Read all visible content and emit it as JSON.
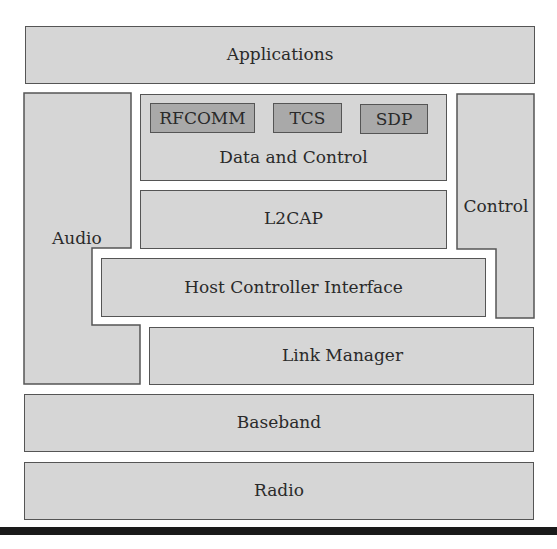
{
  "diagram": {
    "layers": {
      "applications": "Applications",
      "data_and_control": "Data and Control",
      "l2cap": "L2CAP",
      "hci": "Host Controller Interface",
      "link_manager": "Link Manager",
      "baseband": "Baseband",
      "radio": "Radio"
    },
    "side_blocks": {
      "audio": "Audio",
      "control": "Control"
    },
    "protocols": [
      "RFCOMM",
      "TCS",
      "SDP"
    ],
    "colors": {
      "layer_fill": "#d6d6d6",
      "protocol_fill": "#a9a9a9",
      "border": "#555555",
      "bottom_rule": "#1a1a1a"
    }
  }
}
